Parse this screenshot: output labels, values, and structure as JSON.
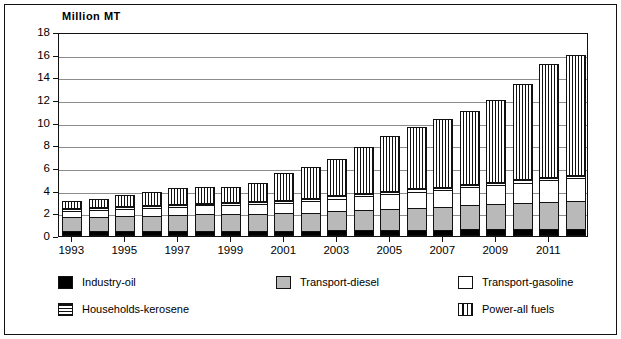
{
  "chart_data": {
    "type": "bar",
    "subtype": "stacked-bar",
    "title": "",
    "xlabel": "",
    "ylabel": "Million  MT",
    "ylim": [
      0,
      18
    ],
    "ytick_step": 2,
    "yticks": [
      0,
      2,
      4,
      6,
      8,
      10,
      12,
      14,
      16,
      18
    ],
    "ytick_labels": [
      "0",
      "2",
      "4",
      "6",
      "8",
      "10",
      "12",
      "14",
      "16",
      "18"
    ],
    "grid": true,
    "grid_axis": "y",
    "legend_position": "bottom",
    "categories": [
      "1993",
      "1994",
      "1995",
      "1996",
      "1997",
      "1998",
      "1999",
      "2000",
      "2001",
      "2002",
      "2003",
      "2004",
      "2005",
      "2006",
      "2007",
      "2008",
      "2009",
      "2010",
      "2011",
      "2012"
    ],
    "xtick_labels_shown": [
      "1993",
      "1995",
      "1997",
      "1999",
      "2001",
      "2003",
      "2005",
      "2007",
      "2009",
      "2011"
    ],
    "series": [
      {
        "name": "Industry-oil",
        "pattern": "solid-black",
        "color": "#000000",
        "values": [
          0.4,
          0.4,
          0.4,
          0.4,
          0.4,
          0.4,
          0.4,
          0.4,
          0.45,
          0.45,
          0.5,
          0.5,
          0.5,
          0.55,
          0.55,
          0.6,
          0.6,
          0.6,
          0.6,
          0.6
        ]
      },
      {
        "name": "Transport-diesel",
        "pattern": "solid-gray",
        "color": "#b9b9b9",
        "values": [
          1.3,
          1.3,
          1.35,
          1.4,
          1.45,
          1.5,
          1.5,
          1.5,
          1.55,
          1.6,
          1.7,
          1.8,
          1.9,
          1.95,
          2.0,
          2.1,
          2.2,
          2.3,
          2.4,
          2.5
        ]
      },
      {
        "name": "Transport-gasoline",
        "pattern": "solid-white",
        "color": "#ffffff",
        "values": [
          0.55,
          0.6,
          0.65,
          0.7,
          0.75,
          0.8,
          0.85,
          0.9,
          0.95,
          1.0,
          1.1,
          1.2,
          1.3,
          1.4,
          1.5,
          1.6,
          1.7,
          1.8,
          1.9,
          2.0
        ]
      },
      {
        "name": "Households-kerosene",
        "pattern": "horizontal-stripes",
        "color": "#ffffff",
        "values": [
          0.25,
          0.25,
          0.25,
          0.25,
          0.25,
          0.25,
          0.25,
          0.25,
          0.25,
          0.3,
          0.3,
          0.3,
          0.3,
          0.3,
          0.3,
          0.3,
          0.3,
          0.3,
          0.3,
          0.3
        ]
      },
      {
        "name": "Power-all fuels",
        "pattern": "vertical-stripes",
        "color": "#ffffff",
        "values": [
          0.6,
          0.75,
          0.95,
          1.15,
          1.35,
          1.35,
          1.3,
          1.65,
          2.4,
          2.75,
          3.2,
          4.1,
          4.85,
          5.4,
          5.95,
          6.45,
          7.2,
          8.4,
          10.0,
          10.6
        ]
      }
    ],
    "totals": [
      3.1,
      3.3,
      3.6,
      3.9,
      4.2,
      4.3,
      4.3,
      4.7,
      5.6,
      6.1,
      6.8,
      7.9,
      8.85,
      9.6,
      10.3,
      11.05,
      12.0,
      13.4,
      15.2,
      16.0
    ],
    "legend": [
      {
        "label": "Industry-oil",
        "pattern": "solid-black",
        "col": 0,
        "row": 0
      },
      {
        "label": "Transport-diesel",
        "pattern": "solid-gray",
        "col": 1,
        "row": 0
      },
      {
        "label": "Transport-gasoline",
        "pattern": "solid-white",
        "col": 2,
        "row": 0
      },
      {
        "label": "Households-kerosene",
        "pattern": "horizontal-stripes",
        "col": 0,
        "row": 1
      },
      {
        "label": "Power-all fuels",
        "pattern": "vertical-stripes",
        "col": 2,
        "row": 1
      }
    ]
  }
}
